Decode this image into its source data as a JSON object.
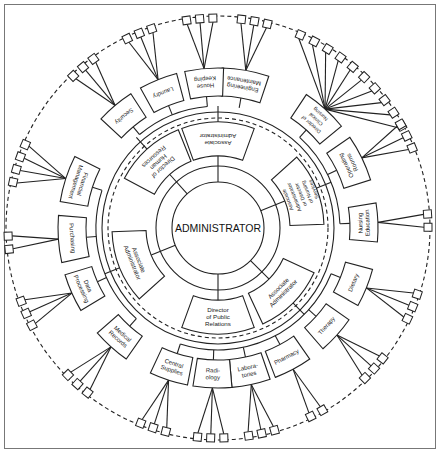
{
  "diagram": {
    "center_label": "ADMINISTRATOR",
    "colors": {
      "line": "#222222",
      "background": "#ffffff",
      "frame": "#777777"
    },
    "associates": [
      {
        "label": [
          "Associate",
          "Administrator"
        ],
        "angle": 0
      },
      {
        "label": [
          "Associate",
          "Administrator",
          "or Director",
          "of Nursing",
          "Services"
        ],
        "angle": 68
      },
      {
        "label": [
          "Associate",
          "Administrator"
        ],
        "angle": 135
      },
      {
        "label": [
          "Director",
          "of Public",
          "Relations"
        ],
        "angle": 180
      },
      {
        "label": [
          "Associate",
          "Administrator"
        ],
        "angle": 248
      },
      {
        "label": [
          "Director of",
          "Human",
          "Resources"
        ],
        "angle": 318
      }
    ],
    "departments": [
      {
        "label": [
          "Engineering",
          "Maintenance"
        ],
        "angle": 10,
        "parent": 0,
        "leaves": 3
      },
      {
        "label": [
          "Director of",
          "Clinical",
          "Nursing"
        ],
        "angle": 42,
        "parent": 1,
        "leaves": 10
      },
      {
        "label": [
          "Operating",
          "Rooms"
        ],
        "angle": 64,
        "parent": 1,
        "leaves": 3
      },
      {
        "label": [
          "Nursing",
          "Education"
        ],
        "angle": 88,
        "parent": 1,
        "leaves": 2
      },
      {
        "label": [
          "Dietary"
        ],
        "angle": 112,
        "parent": 2,
        "leaves": 3
      },
      {
        "label": [
          "Therapy"
        ],
        "angle": 132,
        "parent": 2,
        "leaves": 3
      },
      {
        "label": [
          "Pharmacy"
        ],
        "angle": 152,
        "parent": 2,
        "leaves": 2
      },
      {
        "label": [
          "Labora-",
          "tories"
        ],
        "angle": 168,
        "parent": 2,
        "leaves": 3
      },
      {
        "label": [
          "Radi-",
          "ology"
        ],
        "angle": 182,
        "parent": 2,
        "leaves": 3
      },
      {
        "label": [
          "Central",
          "Supplies"
        ],
        "angle": 198,
        "parent": 2,
        "leaves": 3
      },
      {
        "label": [
          "Medical",
          "Records"
        ],
        "angle": 222,
        "parent": 4,
        "leaves": 3
      },
      {
        "label": [
          "Data",
          "Processing"
        ],
        "angle": 246,
        "parent": 4,
        "leaves": 3
      },
      {
        "label": [
          "Purchasing"
        ],
        "angle": 266,
        "parent": 4,
        "leaves": 2
      },
      {
        "label": [
          "Financial",
          "Management"
        ],
        "angle": 288,
        "parent": 4,
        "leaves": 4
      },
      {
        "label": [
          "Security"
        ],
        "angle": 320,
        "parent": 5,
        "leaves": 3
      },
      {
        "label": [
          "Laundry"
        ],
        "angle": 338,
        "parent": 5,
        "leaves": 3
      },
      {
        "label": [
          "House",
          "Keeping"
        ],
        "angle": 355,
        "parent": 5,
        "leaves": 3
      }
    ]
  }
}
